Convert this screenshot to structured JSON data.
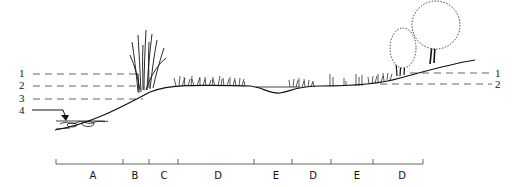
{
  "diagram": {
    "type": "riparian cross-section profile",
    "left_levels": [
      {
        "label": "1",
        "y": 73
      },
      {
        "label": "2",
        "y": 85
      },
      {
        "label": "3",
        "y": 98
      },
      {
        "label": "4",
        "y": 110
      }
    ],
    "right_levels": [
      {
        "label": "1",
        "y": 73
      },
      {
        "label": "2",
        "y": 84
      }
    ],
    "zones": [
      {
        "label": "A",
        "x": 93
      },
      {
        "label": "B",
        "x": 135
      },
      {
        "label": "C",
        "x": 164
      },
      {
        "label": "D",
        "x": 218
      },
      {
        "label": "E",
        "x": 276
      },
      {
        "label": "D",
        "x": 313
      },
      {
        "label": "E",
        "x": 357
      },
      {
        "label": "D",
        "x": 402
      }
    ],
    "scale_ticks": [
      56,
      123,
      149,
      178,
      254,
      292,
      331,
      373,
      423
    ],
    "colors": {
      "ink": "#111111",
      "dash": "#555555",
      "background": "#ffffff"
    }
  }
}
